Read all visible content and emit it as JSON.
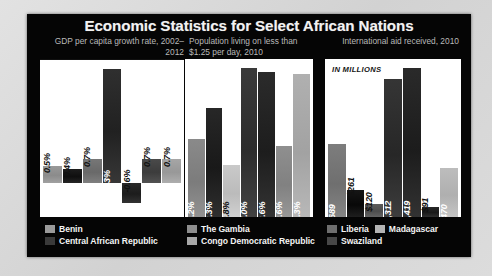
{
  "title": "Economic Statistics for Select African Nations",
  "panels": [
    {
      "subtitle": "GDP per capita growth rate, 2002–2012",
      "note": "",
      "legend": [
        {
          "label": "Benin",
          "color": "#9a9a9a"
        },
        {
          "label": "Central African Republic",
          "color": "#3a3a3a"
        }
      ]
    },
    {
      "subtitle": "Population living on less than $1.25 per day, 2010",
      "note": "",
      "legend": [
        {
          "label": "The Gambia",
          "color": "#8e8e8e"
        },
        {
          "label": "Congo Democratic Republic",
          "color": "#a8a8a8"
        }
      ]
    },
    {
      "subtitle": "International aid received, 2010",
      "note": "IN MILLIONS",
      "legend": [
        {
          "label": "Liberia",
          "color": "#6e6e6e"
        },
        {
          "label": "Madagascar",
          "color": "#b4b4b4"
        },
        {
          "label": "Swaziland",
          "color": "#474747"
        }
      ]
    }
  ],
  "chart_data": [
    {
      "type": "bar",
      "title": "GDP per capita growth rate, 2002–2012",
      "xlabel": "",
      "ylabel": "GDP per capita growth rate (%)",
      "ylim": [
        -1.0,
        3.6
      ],
      "grid": false,
      "legend_position": "bottom",
      "categories": [
        "1",
        "2",
        "3",
        "4",
        "5",
        "6",
        "7"
      ],
      "values": [
        0.5,
        0.4,
        0.7,
        3.3,
        -0.6,
        0.7,
        0.7
      ],
      "labels": [
        "0.5%",
        "0.4%",
        "0.7%",
        "3.3%",
        "-0.6%",
        "0.7%",
        "0.7%"
      ],
      "colors": [
        "#999999",
        "#1d1d1d",
        "#777777",
        "#2f2f2f",
        "#2a2a2a",
        "#4a4a4a",
        "#a6a6a6"
      ],
      "label_colors": [
        "dark",
        "dark",
        "dark",
        "light",
        "dark",
        "dark",
        "dark"
      ]
    },
    {
      "type": "bar",
      "title": "Population living on less than $1.25 per day, 2010",
      "xlabel": "",
      "ylabel": "Population below $1.25/day (%)",
      "ylim": [
        0,
        90
      ],
      "grid": false,
      "legend_position": "bottom",
      "categories": [
        "1",
        "2",
        "3",
        "4",
        "5",
        "6",
        "7"
      ],
      "values": [
        44.2,
        62.3,
        29.8,
        85.0,
        82.6,
        40.6,
        81.3
      ],
      "labels": [
        "44.2%",
        "62.3%",
        "29.8%",
        "85.0%",
        "82.6%",
        "40.6%",
        "81.3%"
      ],
      "colors": [
        "#8a8a8a",
        "#272727",
        "#c9c9c9",
        "#3a3a3a",
        "#2b2b2b",
        "#8f8f8f",
        "#b0b0b0"
      ],
      "label_colors": [
        "light",
        "light",
        "dark",
        "light",
        "light",
        "light",
        "light"
      ]
    },
    {
      "type": "bar",
      "title": "International aid received, 2010",
      "xlabel": "",
      "ylabel": "International aid received (US$ millions)",
      "ylim": [
        0,
        1500
      ],
      "grid": false,
      "legend_position": "bottom",
      "note": "IN MILLIONS",
      "categories": [
        "1",
        "2",
        "3",
        "4",
        "5",
        "6",
        "7"
      ],
      "values": [
        689,
        261,
        120,
        1312,
        1419,
        91,
        470
      ],
      "labels": [
        "$689",
        "$261",
        "$120",
        "$1,312",
        "$1,419",
        "$91",
        "$470"
      ],
      "colors": [
        "#7d7d7d",
        "#161616",
        "#5b5b5b",
        "#353535",
        "#2a2a2a",
        "#272727",
        "#bdbdbd"
      ],
      "label_colors": [
        "light",
        "light",
        "dark",
        "light",
        "light",
        "dark",
        "light"
      ]
    }
  ]
}
